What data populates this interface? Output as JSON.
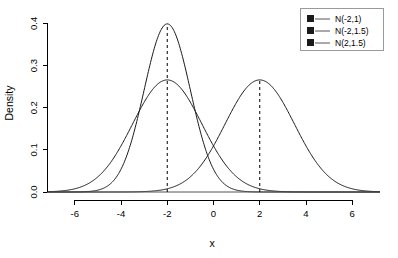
{
  "chart_data": {
    "type": "line",
    "title": "",
    "xlabel": "x",
    "ylabel": "Density",
    "xlim": [
      -7.2,
      7.2
    ],
    "ylim": [
      0.0,
      0.42
    ],
    "xticks": [
      "-6",
      "-4",
      "-2",
      "0",
      "2",
      "4",
      "6"
    ],
    "xtick_values": [
      -6,
      -4,
      -2,
      0,
      2,
      4,
      6
    ],
    "yticks": [
      "0.0",
      "0.1",
      "0.2",
      "0.3",
      "0.4"
    ],
    "ytick_values": [
      0.0,
      0.1,
      0.2,
      0.3,
      0.4
    ],
    "grid": false,
    "legend_position": "top-right",
    "series": [
      {
        "name": "N(-2,1)",
        "distribution": "normal",
        "mean": -2,
        "sd": 1,
        "peak_density": 0.3989,
        "color": "#1a1a1a",
        "linestyle": "solid"
      },
      {
        "name": "N(-2,1.5)",
        "distribution": "normal",
        "mean": -2,
        "sd": 1.5,
        "peak_density": 0.2659,
        "color": "#1a1a1a",
        "linestyle": "solid"
      },
      {
        "name": "N(2,1.5)",
        "distribution": "normal",
        "mean": 2,
        "sd": 1.5,
        "peak_density": 0.2659,
        "color": "#1a1a1a",
        "linestyle": "solid"
      }
    ],
    "annotations": [
      {
        "type": "vline",
        "x": -2,
        "linestyle": "dashed",
        "label": "mean-line-neg2"
      },
      {
        "type": "vline",
        "x": 2,
        "linestyle": "dashed",
        "label": "mean-line-pos2"
      }
    ]
  },
  "legend": {
    "entries": [
      "N(-2,1)",
      "N(-2,1.5)",
      "N(2,1.5)"
    ]
  },
  "axes": {
    "x_title": "x",
    "y_title": "Density"
  }
}
